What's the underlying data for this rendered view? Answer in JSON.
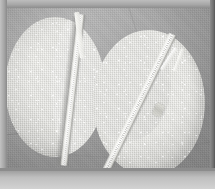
{
  "image": {
    "title": "Two round zippered fabric discs on gray cloth",
    "subject": "sewing-project-photo",
    "caption": "",
    "frame": {
      "border_color": "#9d9d9d",
      "border_top_px": 8,
      "border_left_px": 7,
      "border_right_px": 5,
      "border_bottom_px": 18
    },
    "background": {
      "name": "gray-fabric-backdrop",
      "color": "#a6a6a6",
      "description": "wrinkled medium-gray woven cloth"
    },
    "objects": [
      {
        "name": "left-fabric-disc",
        "label": "Left round pouch",
        "color": "#e2e2dd",
        "shape": "circle",
        "zipper": {
          "name": "left-zipper",
          "orientation": "near-vertical",
          "angle_deg": 6.5,
          "tape_color": "#f7f7f4",
          "state": "open-at-top"
        }
      },
      {
        "name": "right-fabric-disc",
        "label": "Right round pouch",
        "color": "#e5e5e0",
        "shape": "circle",
        "zipper": {
          "name": "right-zipper",
          "orientation": "diagonal",
          "angle_deg": 26,
          "tape_color": "#ffffff",
          "state": "open-at-top",
          "slider_color": "#c6c6c0"
        }
      }
    ]
  }
}
